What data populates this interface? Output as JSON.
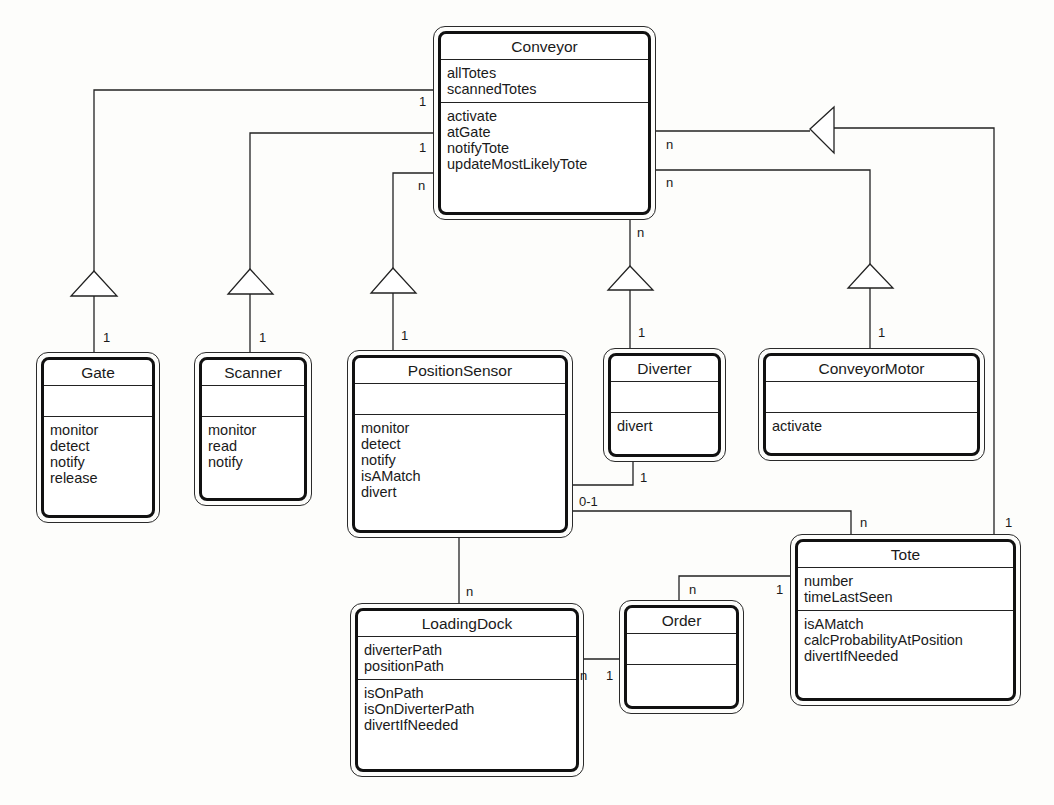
{
  "diagram": {
    "type": "UML class diagram",
    "classes": {
      "conveyor": {
        "name": "Conveyor",
        "attributes": [
          "allTotes",
          "scannedTotes"
        ],
        "operations": [
          "activate",
          "atGate",
          "notifyTote",
          "updateMostLikelyTote"
        ]
      },
      "gate": {
        "name": "Gate",
        "attributes": [],
        "operations": [
          "monitor",
          "detect",
          "notify",
          "release"
        ]
      },
      "scanner": {
        "name": "Scanner",
        "attributes": [],
        "operations": [
          "monitor",
          "read",
          "notify"
        ]
      },
      "position_sensor": {
        "name": "PositionSensor",
        "attributes": [],
        "operations": [
          "monitor",
          "detect",
          "notify",
          "isAMatch",
          "divert"
        ]
      },
      "diverter": {
        "name": "Diverter",
        "attributes": [],
        "operations": [
          "divert"
        ]
      },
      "conveyor_motor": {
        "name": "ConveyorMotor",
        "attributes": [],
        "operations": [
          "activate"
        ]
      },
      "tote": {
        "name": "Tote",
        "attributes": [
          "number",
          "timeLastSeen"
        ],
        "operations": [
          "isAMatch",
          "calcProbabilityAtPosition",
          "divertIfNeeded"
        ]
      },
      "order": {
        "name": "Order",
        "attributes": [],
        "operations": []
      },
      "loading_dock": {
        "name": "LoadingDock",
        "attributes": [
          "diverterPath",
          "positionPath"
        ],
        "operations": [
          "isOnPath",
          "isOnDiverterPath",
          "divertIfNeeded"
        ]
      }
    },
    "relationships": [
      {
        "from": "Conveyor",
        "to": "Gate",
        "kind": "aggregation",
        "from_mult": "1",
        "to_mult": "1"
      },
      {
        "from": "Conveyor",
        "to": "Scanner",
        "kind": "aggregation",
        "from_mult": "1",
        "to_mult": "1"
      },
      {
        "from": "Conveyor",
        "to": "PositionSensor",
        "kind": "aggregation",
        "from_mult": "n",
        "to_mult": "1"
      },
      {
        "from": "Conveyor",
        "to": "Diverter",
        "kind": "aggregation",
        "from_mult": "n",
        "to_mult": "1"
      },
      {
        "from": "Conveyor",
        "to": "ConveyorMotor",
        "kind": "aggregation",
        "from_mult": "n",
        "to_mult": "1"
      },
      {
        "from": "Conveyor",
        "to": "Tote",
        "kind": "aggregation",
        "from_mult": "n",
        "to_mult": "1"
      },
      {
        "from": "PositionSensor",
        "to": "Diverter",
        "kind": "association",
        "to_mult": "1"
      },
      {
        "from": "PositionSensor",
        "to": "Tote",
        "kind": "association",
        "from_mult": "0-1",
        "to_mult": "n"
      },
      {
        "from": "PositionSensor",
        "to": "LoadingDock",
        "kind": "association",
        "to_mult": "n"
      },
      {
        "from": "LoadingDock",
        "to": "Order",
        "kind": "association",
        "from_mult": "n",
        "to_mult": "1"
      },
      {
        "from": "Order",
        "to": "Tote",
        "kind": "association",
        "from_mult": "n",
        "to_mult": "1"
      }
    ],
    "multiplicity_labels": {
      "gate_top": "1",
      "gate_bottom": "1",
      "scanner_top": "1",
      "scanner_bottom": "1",
      "ps_top": "n",
      "ps_bottom": "1",
      "div_top": "n",
      "div_bottom": "1",
      "motor_top": "n",
      "motor_bottom": "1",
      "tote_conv_top": "n",
      "tote_conv_bottom": "1",
      "ps_div": "1",
      "ps_tote_left": "0-1",
      "ps_tote_right": "n",
      "ps_dock": "n",
      "dock_order_left": "n",
      "dock_order_right": "1",
      "order_tote_left": "n",
      "order_tote_right": "1"
    }
  }
}
